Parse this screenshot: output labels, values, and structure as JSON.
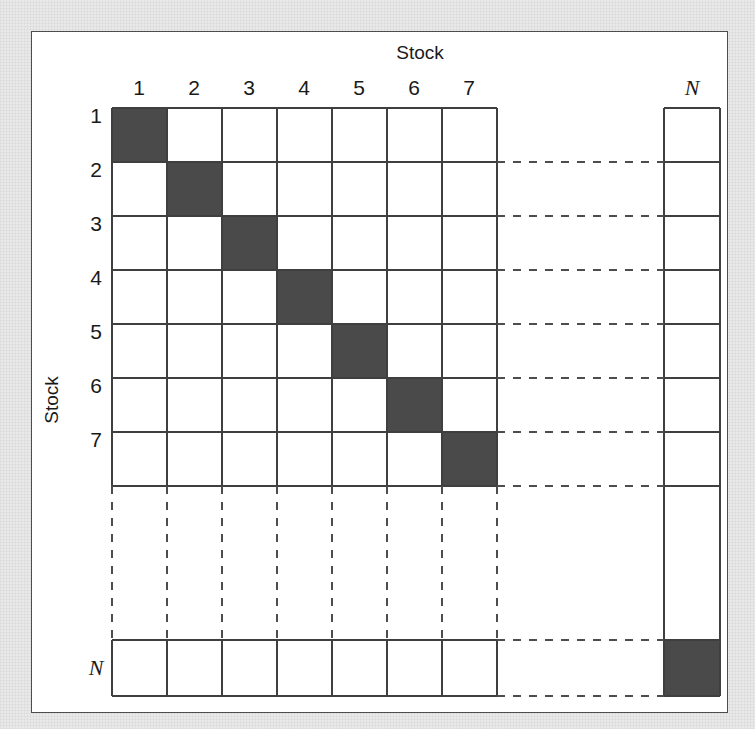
{
  "figure": {
    "type": "diagram",
    "axis_titles": {
      "top": "Stock",
      "left": "Stock"
    },
    "column_headers": [
      "1",
      "2",
      "3",
      "4",
      "5",
      "6",
      "7",
      "N"
    ],
    "row_headers": [
      "1",
      "2",
      "3",
      "4",
      "5",
      "6",
      "7",
      "N"
    ],
    "ellipsis_header": "",
    "colors": {
      "filled_cell": "#4a4a4a",
      "empty_cell": "#ffffff",
      "grid_line": "#3f3f3f",
      "dashed_line": "#4d4d4d",
      "frame": "#4d4d4d",
      "page_background": "#e9e9e9",
      "card_background": "#ffffff"
    },
    "filled_cells": [
      {
        "row": "1",
        "col": "1"
      },
      {
        "row": "2",
        "col": "2"
      },
      {
        "row": "3",
        "col": "3"
      },
      {
        "row": "4",
        "col": "4"
      },
      {
        "row": "5",
        "col": "5"
      },
      {
        "row": "6",
        "col": "6"
      },
      {
        "row": "7",
        "col": "7"
      },
      {
        "row": "N",
        "col": "N"
      }
    ],
    "notes": {
      "structure": "8x8 schematic grid; rows/cols 1-7 drawn solid, gap to row/col N drawn with dashed continuation lines; only diagonal entries shaded.",
      "dash_pattern": "8 8"
    }
  }
}
